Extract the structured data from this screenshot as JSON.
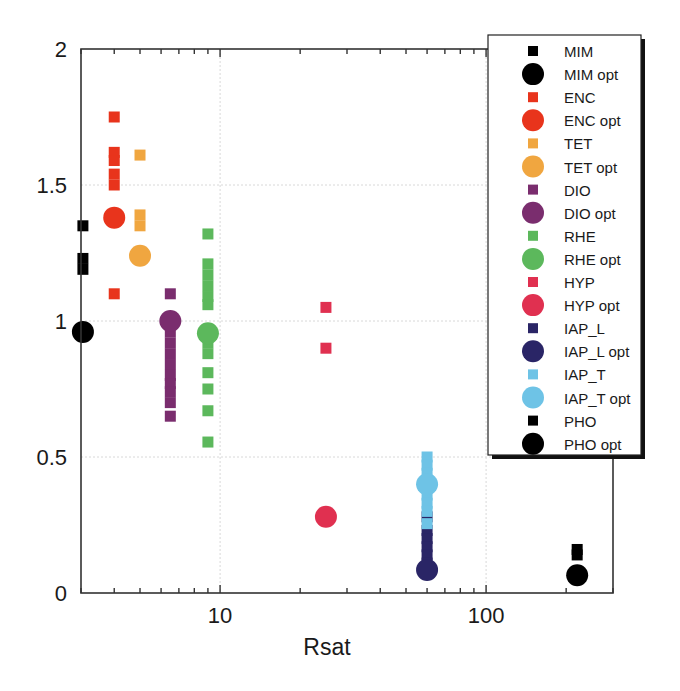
{
  "chart_data": {
    "type": "scatter",
    "title": "",
    "xlabel": "Rsat",
    "ylabel": "",
    "xscale": "log",
    "xlim": [
      3,
      300
    ],
    "ylim": [
      0,
      2
    ],
    "x_ticks": [
      {
        "value": 10,
        "label": "10"
      },
      {
        "value": 100,
        "label": "100"
      }
    ],
    "y_ticks": [
      {
        "value": 0,
        "label": "0"
      },
      {
        "value": 0.5,
        "label": "0.5"
      },
      {
        "value": 1,
        "label": "1"
      },
      {
        "value": 1.5,
        "label": "1.5"
      },
      {
        "value": 2,
        "label": "2"
      }
    ],
    "grid": true,
    "legend_position": "upper right",
    "series": [
      {
        "name": "MIM",
        "marker": "square",
        "color": "#000000",
        "x": [
          3.05,
          3.05,
          3.05
        ],
        "y": [
          1.35,
          1.23,
          1.19
        ]
      },
      {
        "name": "MIM opt",
        "marker": "circle",
        "color": "#000000",
        "x": [
          3.05
        ],
        "y": [
          0.96
        ]
      },
      {
        "name": "ENC",
        "marker": "square",
        "color": "#e8341c",
        "x": [
          4,
          4,
          4,
          4,
          4,
          4
        ],
        "y": [
          1.75,
          1.62,
          1.59,
          1.54,
          1.5,
          1.1
        ]
      },
      {
        "name": "ENC opt",
        "marker": "circle",
        "color": "#e8341c",
        "x": [
          4
        ],
        "y": [
          1.38
        ]
      },
      {
        "name": "TET",
        "marker": "square",
        "color": "#f0a640",
        "x": [
          5,
          5,
          5
        ],
        "y": [
          1.61,
          1.39,
          1.35
        ]
      },
      {
        "name": "TET opt",
        "marker": "circle",
        "color": "#f0a640",
        "x": [
          5
        ],
        "y": [
          1.24
        ]
      },
      {
        "name": "DIO",
        "marker": "square",
        "color": "#7a2d6e",
        "x": [
          6.5,
          6.5,
          6.5,
          6.5,
          6.5,
          6.5,
          6.5,
          6.5,
          6.5,
          6.5
        ],
        "y": [
          1.1,
          0.96,
          0.92,
          0.88,
          0.84,
          0.8,
          0.77,
          0.74,
          0.7,
          0.65
        ]
      },
      {
        "name": "DIO opt",
        "marker": "circle",
        "color": "#7a2d6e",
        "x": [
          6.5
        ],
        "y": [
          1.0
        ]
      },
      {
        "name": "RHE",
        "marker": "square",
        "color": "#5cb85c",
        "x": [
          9,
          9,
          9,
          9,
          9,
          9,
          9,
          9,
          9,
          9,
          9,
          9
        ],
        "y": [
          1.32,
          1.21,
          1.17,
          1.13,
          1.09,
          0.92,
          0.88,
          0.81,
          0.75,
          0.67,
          0.555,
          1.06
        ]
      },
      {
        "name": "RHE opt",
        "marker": "circle",
        "color": "#5cb85c",
        "x": [
          9
        ],
        "y": [
          0.955
        ]
      },
      {
        "name": "HYP",
        "marker": "square",
        "color": "#e03050",
        "x": [
          25,
          25
        ],
        "y": [
          1.05,
          0.9
        ]
      },
      {
        "name": "HYP opt",
        "marker": "circle",
        "color": "#e03050",
        "x": [
          25
        ],
        "y": [
          0.28
        ]
      },
      {
        "name": "IAP_L",
        "marker": "square",
        "color": "#2a2566",
        "x": [
          60,
          60,
          60,
          60,
          60,
          60
        ],
        "y": [
          0.28,
          0.23,
          0.2,
          0.17,
          0.14,
          0.11
        ]
      },
      {
        "name": "IAP_L opt",
        "marker": "circle",
        "color": "#2a2566",
        "x": [
          60
        ],
        "y": [
          0.085
        ]
      },
      {
        "name": "IAP_T",
        "marker": "square",
        "color": "#6ec3e6",
        "x": [
          60,
          60,
          60,
          60,
          60,
          60,
          60
        ],
        "y": [
          0.5,
          0.47,
          0.44,
          0.36,
          0.33,
          0.3,
          0.255
        ]
      },
      {
        "name": "IAP_T opt",
        "marker": "circle",
        "color": "#6ec3e6",
        "x": [
          60
        ],
        "y": [
          0.4
        ]
      },
      {
        "name": "PHO",
        "marker": "square",
        "color": "#000000",
        "x": [
          220,
          220
        ],
        "y": [
          0.16,
          0.14
        ]
      },
      {
        "name": "PHO opt",
        "marker": "circle",
        "color": "#000000",
        "x": [
          220
        ],
        "y": [
          0.065
        ]
      }
    ]
  },
  "legend": {
    "items": [
      {
        "label": "MIM",
        "marker": "square",
        "color": "#000000"
      },
      {
        "label": "MIM opt",
        "marker": "circle",
        "color": "#000000"
      },
      {
        "label": "ENC",
        "marker": "square",
        "color": "#e8341c"
      },
      {
        "label": "ENC opt",
        "marker": "circle",
        "color": "#e8341c"
      },
      {
        "label": "TET",
        "marker": "square",
        "color": "#f0a640"
      },
      {
        "label": "TET opt",
        "marker": "circle",
        "color": "#f0a640"
      },
      {
        "label": "DIO",
        "marker": "square",
        "color": "#7a2d6e"
      },
      {
        "label": "DIO opt",
        "marker": "circle",
        "color": "#7a2d6e"
      },
      {
        "label": "RHE",
        "marker": "square",
        "color": "#5cb85c"
      },
      {
        "label": "RHE opt",
        "marker": "circle",
        "color": "#5cb85c"
      },
      {
        "label": "HYP",
        "marker": "square",
        "color": "#e03050"
      },
      {
        "label": "HYP opt",
        "marker": "circle",
        "color": "#e03050"
      },
      {
        "label": "IAP_L",
        "marker": "square",
        "color": "#2a2566"
      },
      {
        "label": "IAP_L opt",
        "marker": "circle",
        "color": "#2a2566"
      },
      {
        "label": "IAP_T",
        "marker": "square",
        "color": "#6ec3e6"
      },
      {
        "label": "IAP_T opt",
        "marker": "circle",
        "color": "#6ec3e6"
      },
      {
        "label": "PHO",
        "marker": "square",
        "color": "#000000"
      },
      {
        "label": "PHO opt",
        "marker": "circle",
        "color": "#000000"
      }
    ]
  },
  "axes": {
    "x_label": "Rsat"
  }
}
